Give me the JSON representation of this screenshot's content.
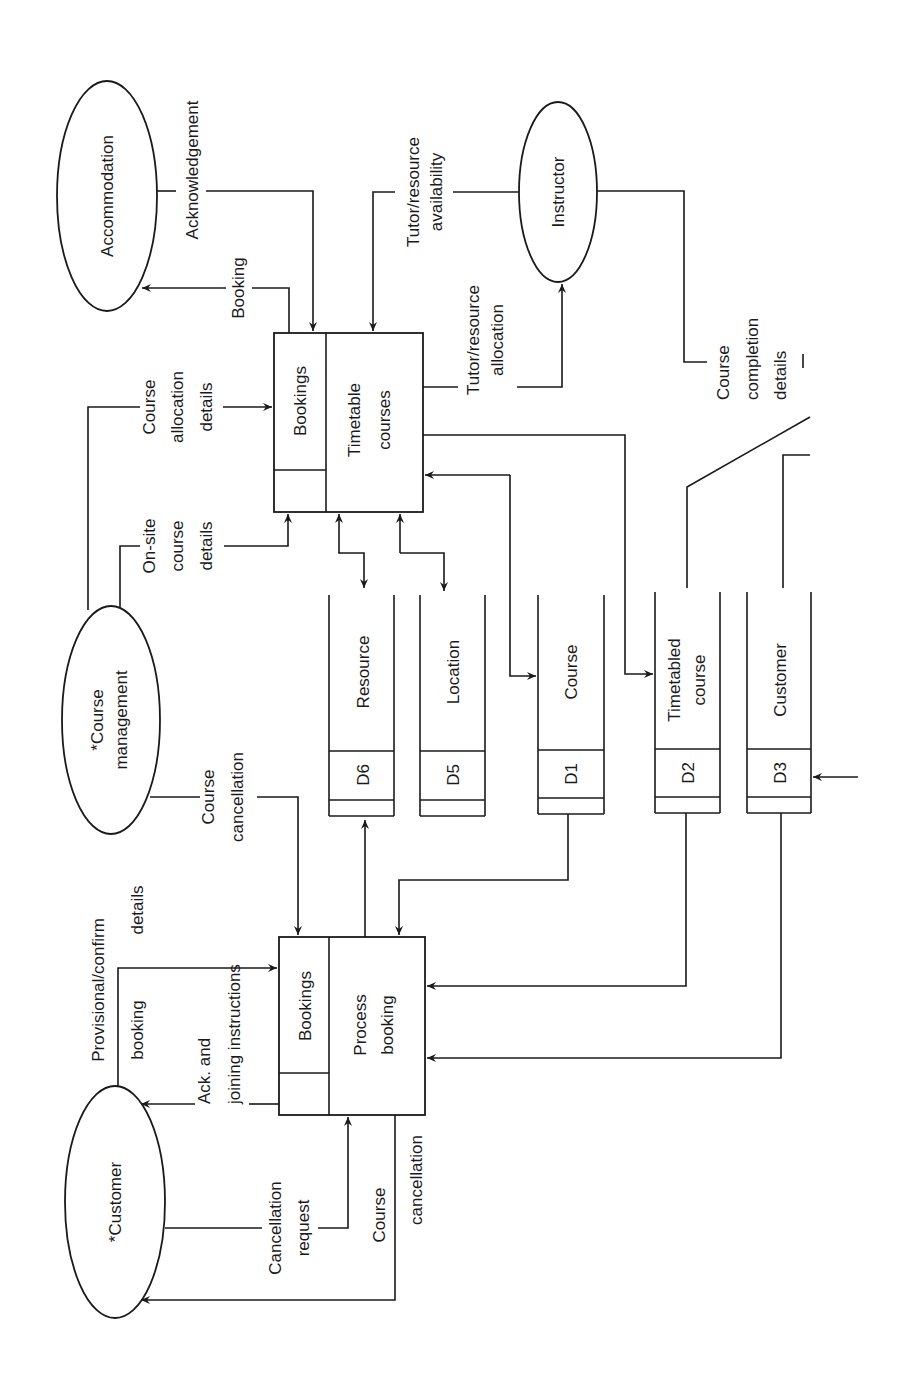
{
  "diagram": {
    "type": "data-flow-diagram",
    "orientation": "rotated-90-ccw",
    "external_entities": [
      {
        "id": "accommodation",
        "label": "Accommodation"
      },
      {
        "id": "instructor",
        "label": "Instructor"
      },
      {
        "id": "course_management",
        "label_line1": "*Course",
        "label_line2": "management"
      },
      {
        "id": "customer",
        "label": "*Customer"
      }
    ],
    "processes": [
      {
        "id": "timetable_courses",
        "location": "Bookings",
        "name_line1": "Timetable",
        "name_line2": "courses"
      },
      {
        "id": "process_booking",
        "location": "Bookings",
        "name_line1": "Process",
        "name_line2": "booking"
      }
    ],
    "data_stores": [
      {
        "id": "D6",
        "ref": "D6",
        "name": "Resource"
      },
      {
        "id": "D5",
        "ref": "D5",
        "name": "Location"
      },
      {
        "id": "D1",
        "ref": "D1",
        "name": "Course"
      },
      {
        "id": "D2",
        "ref": "D2",
        "name_line1": "Timetabled",
        "name_line2": "course"
      },
      {
        "id": "D3",
        "ref": "D3",
        "name": "Customer"
      }
    ],
    "flows": {
      "acknowledgement": "Acknowledgement",
      "booking": "Booking",
      "tutor_avail_1": "Tutor/resource",
      "tutor_avail_2": "availability",
      "tutor_alloc_1": "Tutor/resource",
      "tutor_alloc_2": "allocation",
      "course_completion_1": "Course",
      "course_completion_2": "completion",
      "course_completion_3": "details",
      "course_alloc_1": "Course",
      "course_alloc_2": "allocation",
      "course_alloc_3": "details",
      "onsite_1": "On-site",
      "onsite_2": "course",
      "onsite_3": "details",
      "cm_cancel_1": "Course",
      "cm_cancel_2": "cancellation",
      "prov_1": "Provisional/confirm",
      "prov_2": "booking",
      "prov_3": "details",
      "ack_join_1": "Ack.  and",
      "ack_join_2": "joining instructions",
      "cancel_req_1": "Cancellation",
      "cancel_req_2": "request",
      "cust_cancel_1": "Course",
      "cust_cancel_2": "cancellation"
    }
  }
}
